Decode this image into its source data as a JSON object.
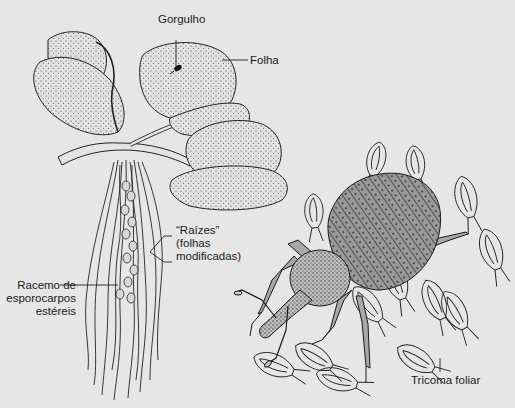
{
  "figure": {
    "background_color": "#e6e6e6",
    "ink_color": "#1a1a1a",
    "labels": {
      "weevil_on_leaf": "Gorgulho",
      "leaf": "Folha",
      "roots_line1": "“Raízes”",
      "roots_line2": "(folhas",
      "roots_line3": "modificadas)",
      "racemes_line1": "Racemo de",
      "racemes_line2": "esporocarpos",
      "racemes_line3": "estéreis",
      "trichome": "Tricoma foliar"
    }
  }
}
